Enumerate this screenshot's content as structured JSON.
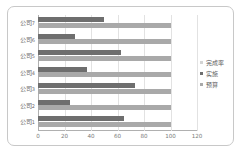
{
  "chart_data": {
    "type": "bar",
    "orientation": "horizontal",
    "title": "",
    "xlabel": "",
    "ylabel": "",
    "categories": [
      "公司7",
      "公司6",
      "公司5",
      "公司4",
      "公司3",
      "公司2",
      "公司1"
    ],
    "category_order_top_to_bottom": [
      "公司7",
      "公司6",
      "公司5",
      "公司4",
      "公司3",
      "公司2",
      "公司1"
    ],
    "series": [
      {
        "name": "完成率",
        "color": "#d4d4d4",
        "values": [
          0,
          0,
          0,
          0,
          0,
          0,
          0
        ]
      },
      {
        "name": "实施",
        "color": "#6e6e6e",
        "values": [
          50,
          28,
          63,
          37,
          73,
          24,
          65
        ]
      },
      {
        "name": "预算",
        "color": "#a9a9a9",
        "values": [
          100,
          100,
          100,
          100,
          100,
          100,
          100
        ]
      }
    ],
    "xticks": [
      0,
      20,
      40,
      60,
      80,
      100,
      120
    ],
    "xlim": [
      0,
      120
    ],
    "grid": true,
    "legend_position": "right"
  },
  "legend": {
    "items": [
      {
        "label": "完成率",
        "color": "#d4d4d4"
      },
      {
        "label": "实施",
        "color": "#6e6e6e"
      },
      {
        "label": "预算",
        "color": "#a9a9a9"
      }
    ]
  }
}
